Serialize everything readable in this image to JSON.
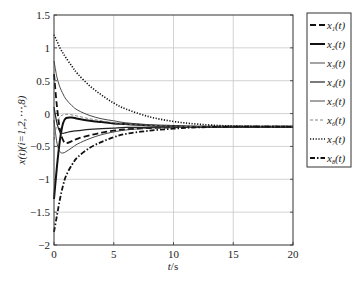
{
  "chart_data": {
    "type": "line",
    "title": "",
    "xlabel": "t/s",
    "ylabel": "x_i(t)(i=1,2,⋯,8)",
    "xlim": [
      0,
      20
    ],
    "ylim": [
      -2,
      1.5
    ],
    "xticks": [
      0,
      5,
      10,
      15,
      20
    ],
    "yticks": [
      -2,
      -1.5,
      -1,
      -0.5,
      0,
      0.5,
      1,
      1.5
    ],
    "xtick_labels": [
      "0",
      "5",
      "10",
      "15",
      "20"
    ],
    "ytick_labels": [
      "−2",
      "−1.5",
      "−1",
      "−0.5",
      "0",
      "0.5",
      "1",
      "1.5"
    ],
    "grid": true,
    "legend_position": "outside-right-top",
    "steady_state": -0.2,
    "x": [
      0,
      0.25,
      0.5,
      0.75,
      1,
      1.5,
      2,
      3,
      4,
      5,
      6,
      8,
      10,
      12,
      15,
      20
    ],
    "series": [
      {
        "name": "x1(t)",
        "label_main": "x",
        "label_sub": "1",
        "style": "dashed-thick",
        "values": [
          0.6,
          0.1,
          -0.25,
          -0.4,
          -0.45,
          -0.42,
          -0.38,
          -0.33,
          -0.29,
          -0.26,
          -0.24,
          -0.22,
          -0.21,
          -0.2,
          -0.2,
          -0.2
        ]
      },
      {
        "name": "x2(t)",
        "label_main": "x",
        "label_sub": "2",
        "style": "solid-thick",
        "values": [
          -1.3,
          -0.8,
          -0.4,
          -0.15,
          -0.07,
          -0.06,
          -0.08,
          -0.11,
          -0.13,
          -0.15,
          -0.16,
          -0.18,
          -0.19,
          -0.2,
          -0.2,
          -0.2
        ]
      },
      {
        "name": "x3(t)",
        "label_main": "x",
        "label_sub": "3",
        "style": "solid-thin",
        "values": [
          0.8,
          0.55,
          0.4,
          0.3,
          0.22,
          0.12,
          0.05,
          -0.03,
          -0.08,
          -0.11,
          -0.14,
          -0.17,
          -0.19,
          -0.2,
          -0.2,
          -0.2
        ]
      },
      {
        "name": "x4(t)",
        "label_main": "x",
        "label_sub": "4",
        "style": "solid-medium",
        "values": [
          0.1,
          -0.15,
          -0.28,
          -0.3,
          -0.29,
          -0.27,
          -0.26,
          -0.24,
          -0.23,
          -0.22,
          -0.21,
          -0.21,
          -0.2,
          -0.2,
          -0.2,
          -0.2
        ]
      },
      {
        "name": "x5(t)",
        "label_main": "x",
        "label_sub": "5",
        "style": "solid-thin",
        "values": [
          -0.1,
          -0.45,
          -0.58,
          -0.6,
          -0.58,
          -0.52,
          -0.46,
          -0.38,
          -0.32,
          -0.28,
          -0.25,
          -0.22,
          -0.21,
          -0.2,
          -0.2,
          -0.2
        ]
      },
      {
        "name": "x6(t)",
        "label_main": "x",
        "label_sub": "6",
        "style": "dashed-thin-gray",
        "values": [
          -0.4,
          -0.15,
          -0.05,
          -0.02,
          -0.01,
          -0.02,
          -0.04,
          -0.08,
          -0.11,
          -0.14,
          -0.16,
          -0.18,
          -0.19,
          -0.2,
          -0.2,
          -0.2
        ]
      },
      {
        "name": "x7(t)",
        "label_main": "x",
        "label_sub": "7",
        "style": "dotted",
        "values": [
          1.2,
          1.1,
          1.0,
          0.92,
          0.85,
          0.72,
          0.6,
          0.42,
          0.28,
          0.16,
          0.07,
          -0.05,
          -0.12,
          -0.16,
          -0.19,
          -0.2
        ]
      },
      {
        "name": "x8(t)",
        "label_main": "x",
        "label_sub": "8",
        "style": "dashdot-thick",
        "values": [
          -1.8,
          -1.55,
          -1.3,
          -1.1,
          -0.95,
          -0.78,
          -0.66,
          -0.52,
          -0.43,
          -0.36,
          -0.31,
          -0.26,
          -0.23,
          -0.21,
          -0.2,
          -0.2
        ]
      }
    ]
  },
  "axes": {
    "xlabel_main": "t",
    "xlabel_unit": "/s",
    "ylabel": "x(t)(i=1,2,⋯,8)"
  }
}
